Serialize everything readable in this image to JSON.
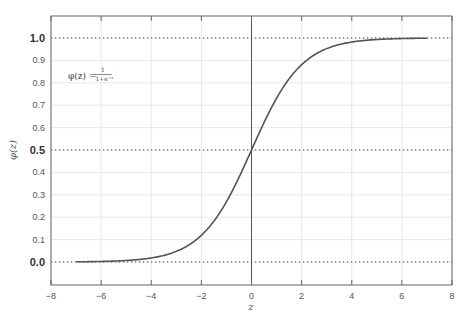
{
  "chart_data": {
    "type": "line",
    "title": "",
    "xlabel": "z",
    "ylabel": "φ(z)",
    "xlim": [
      -8,
      8
    ],
    "ylim": [
      -0.1,
      1.1
    ],
    "grid": true,
    "legend": null,
    "x_ticks": [
      "−8",
      "−6",
      "−4",
      "−2",
      "0",
      "2",
      "4",
      "6",
      "8"
    ],
    "x_tick_values": [
      -8,
      -6,
      -4,
      -2,
      0,
      2,
      4,
      6,
      8
    ],
    "y_ticks": [
      "0.0",
      "0.1",
      "0.2",
      "0.3",
      "0.4",
      "0.5",
      "0.6",
      "0.7",
      "0.8",
      "0.9",
      "1.0"
    ],
    "y_tick_values": [
      0.0,
      0.1,
      0.2,
      0.3,
      0.4,
      0.5,
      0.6,
      0.7,
      0.8,
      0.9,
      1.0
    ],
    "bold_y_ticks": [
      0.0,
      0.5,
      1.0
    ],
    "horizontal_dotted_lines": [
      0.0,
      0.5,
      1.0
    ],
    "vertical_line": 0,
    "annotation": {
      "text": "φ(z) = 1/(1+e^−z)",
      "lhs": "φ(z) =",
      "numerator": "1",
      "denominator": "1+e",
      "exponent": "−z",
      "position": {
        "x": -6.8,
        "y": 0.83
      }
    },
    "series": [
      {
        "name": "sigmoid",
        "function": "1/(1+exp(-z))",
        "x_range": [
          -7,
          7
        ],
        "x": [
          -7,
          -6,
          -5,
          -4,
          -3,
          -2,
          -1,
          0,
          1,
          2,
          3,
          4,
          5,
          6,
          7
        ],
        "values": [
          0.001,
          0.002,
          0.007,
          0.018,
          0.047,
          0.119,
          0.269,
          0.5,
          0.731,
          0.881,
          0.953,
          0.982,
          0.993,
          0.998,
          0.999
        ],
        "color": "#555555"
      }
    ]
  },
  "colors": {
    "curve": "#555555",
    "axes": "#555555",
    "grid": "#e8e8e8",
    "dotted": "#444444"
  }
}
